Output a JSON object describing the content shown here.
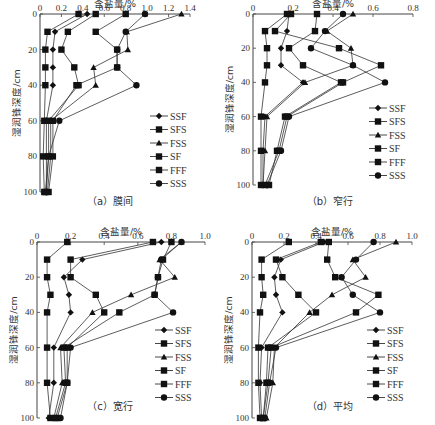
{
  "figure": {
    "x_axis_title": "含盐量/%",
    "y_axis_title": "湿润锋深度/cm",
    "legend": [
      {
        "name": "SSF",
        "marker": "diamond"
      },
      {
        "name": "SFS",
        "marker": "square"
      },
      {
        "name": "FSS",
        "marker": "triangle"
      },
      {
        "name": "SF",
        "marker": "square"
      },
      {
        "name": "FFF",
        "marker": "square"
      },
      {
        "name": "SSS",
        "marker": "circle"
      }
    ]
  },
  "chart_data": [
    {
      "type": "line",
      "title": "（a）膜间",
      "xlabel": "含盐量/%",
      "ylabel": "湿润锋深度/cm",
      "xlim": [
        0,
        1.4
      ],
      "xticks": [
        "0",
        "0.2",
        "0.4",
        "0.6",
        "0.8",
        "1.0",
        "1.2",
        "1.4"
      ],
      "ylim": [
        0,
        100
      ],
      "yticks": [
        "0",
        "20",
        "40",
        "60",
        "80",
        "100"
      ],
      "y": [
        0,
        10,
        20,
        30,
        40,
        60,
        80,
        100
      ],
      "series": [
        {
          "name": "SSF",
          "values": [
            0.44,
            0.14,
            0.12,
            0.12,
            0.12,
            0.06,
            0.06,
            0.06
          ]
        },
        {
          "name": "SFS",
          "values": [
            0.36,
            0.07,
            0.05,
            0.05,
            0.05,
            0.04,
            0.03,
            0.04
          ]
        },
        {
          "name": "FSS",
          "values": [
            1.32,
            0.81,
            0.82,
            0.5,
            0.52,
            0.1,
            0.1,
            0.07
          ]
        },
        {
          "name": "SF",
          "values": [
            0.52,
            0.26,
            0.2,
            0.32,
            0.36,
            0.08,
            0.08,
            0.05
          ]
        },
        {
          "name": "FFF",
          "values": [
            0.8,
            0.52,
            0.72,
            0.72,
            0.34,
            0.12,
            0.12,
            0.08
          ]
        },
        {
          "name": "SSS",
          "values": [
            0.98,
            0.8,
            0.72,
            0.72,
            0.9,
            0.18,
            0.08,
            0.06
          ]
        }
      ]
    },
    {
      "type": "line",
      "title": "（b）窄行",
      "xlabel": "含盐量/%",
      "ylabel": "湿润锋深度/cm",
      "xlim": [
        0,
        0.8
      ],
      "xticks": [
        "0",
        "0.2",
        "0.4",
        "0.6",
        "0.8"
      ],
      "ylim": [
        0,
        100
      ],
      "yticks": [
        "0",
        "20",
        "40",
        "60",
        "80",
        "100"
      ],
      "y": [
        0,
        10,
        20,
        30,
        40,
        60,
        80,
        100
      ],
      "series": [
        {
          "name": "SSF",
          "values": [
            0.18,
            0.17,
            0.14,
            0.14,
            0.25,
            0.06,
            0.05,
            0.05
          ]
        },
        {
          "name": "SFS",
          "values": [
            0.17,
            0.06,
            0.07,
            0.07,
            0.06,
            0.04,
            0.04,
            0.04
          ]
        },
        {
          "name": "FSS",
          "values": [
            0.5,
            0.37,
            0.49,
            0.5,
            0.26,
            0.07,
            0.06,
            0.05
          ]
        },
        {
          "name": "SF",
          "values": [
            0.32,
            0.31,
            0.18,
            0.25,
            0.44,
            0.16,
            0.12,
            0.08
          ]
        },
        {
          "name": "FFF",
          "values": [
            0.19,
            0.11,
            0.43,
            0.64,
            0.45,
            0.17,
            0.13,
            0.06
          ]
        },
        {
          "name": "SSS",
          "values": [
            0.45,
            0.36,
            0.29,
            0.5,
            0.66,
            0.18,
            0.14,
            0.07
          ]
        }
      ]
    },
    {
      "type": "line",
      "title": "（c）宽行",
      "xlabel": "含盐量/%",
      "ylabel": "湿润锋深度/cm",
      "xlim": [
        0,
        1.0
      ],
      "xticks": [
        "0",
        "0.2",
        "0.4",
        "0.6",
        "0.8",
        "1.0"
      ],
      "ylim": [
        0,
        100
      ],
      "yticks": [
        "0",
        "20",
        "40",
        "60",
        "80",
        "100"
      ],
      "y": [
        0,
        10,
        20,
        30,
        40,
        60,
        80,
        100
      ],
      "series": [
        {
          "name": "SSF",
          "values": [
            0.74,
            0.27,
            0.16,
            0.19,
            0.2,
            0.1,
            0.1,
            0.07
          ]
        },
        {
          "name": "SFS",
          "values": [
            0.18,
            0.06,
            0.06,
            0.08,
            0.06,
            0.06,
            0.06,
            0.08
          ]
        },
        {
          "name": "FSS",
          "values": [
            0.86,
            0.73,
            0.82,
            0.56,
            0.33,
            0.14,
            0.15,
            0.1
          ]
        },
        {
          "name": "SF",
          "values": [
            0.69,
            0.2,
            0.2,
            0.35,
            0.4,
            0.18,
            0.18,
            0.12
          ]
        },
        {
          "name": "FFF",
          "values": [
            0.8,
            0.75,
            0.72,
            0.7,
            0.49,
            0.16,
            0.17,
            0.11
          ]
        },
        {
          "name": "SSS",
          "values": [
            0.86,
            0.74,
            0.72,
            0.7,
            0.81,
            0.2,
            0.18,
            0.14
          ]
        }
      ]
    },
    {
      "type": "line",
      "title": "（d）平均",
      "xlabel": "含盐量/%",
      "ylabel": "湿润锋深度/cm",
      "xlim": [
        0,
        1.0
      ],
      "xticks": [
        "0",
        "0.2",
        "0.4",
        "0.6",
        "0.8",
        "1.0"
      ],
      "ylim": [
        0,
        100
      ],
      "yticks": [
        "0",
        "20",
        "40",
        "60",
        "80",
        "100"
      ],
      "y": [
        0,
        10,
        20,
        30,
        40,
        60,
        80,
        100
      ],
      "series": [
        {
          "name": "SSF",
          "values": [
            0.45,
            0.18,
            0.14,
            0.15,
            0.19,
            0.06,
            0.05,
            0.06
          ]
        },
        {
          "name": "SFS",
          "values": [
            0.23,
            0.06,
            0.06,
            0.07,
            0.05,
            0.04,
            0.04,
            0.05
          ]
        },
        {
          "name": "FSS",
          "values": [
            0.9,
            0.63,
            0.71,
            0.5,
            0.36,
            0.14,
            0.13,
            0.09
          ]
        },
        {
          "name": "SF",
          "values": [
            0.43,
            0.15,
            0.19,
            0.29,
            0.4,
            0.1,
            0.09,
            0.07
          ]
        },
        {
          "name": "FFF",
          "values": [
            0.48,
            0.47,
            0.52,
            0.79,
            0.65,
            0.12,
            0.1,
            0.07
          ]
        },
        {
          "name": "SSS",
          "values": [
            0.76,
            0.65,
            0.56,
            0.63,
            0.8,
            0.15,
            0.11,
            0.08
          ]
        }
      ]
    }
  ],
  "layout": {
    "panels": [
      {
        "x0": 40,
        "x1": 190,
        "y0": 14,
        "y1": 192,
        "legend_x": 168,
        "legend_y": 116,
        "caption_x": 110,
        "caption_y": 205,
        "xtitle_y": 7
      },
      {
        "x0": 253,
        "x1": 413,
        "y0": 14,
        "y1": 185,
        "legend_x": 387,
        "legend_y": 108,
        "caption_x": 330,
        "caption_y": 205,
        "xtitle_y": 7
      },
      {
        "x0": 37,
        "x1": 205,
        "y0": 242,
        "y1": 418,
        "legend_x": 173,
        "legend_y": 330,
        "caption_x": 110,
        "caption_y": 410,
        "xtitle_y": 235
      },
      {
        "x0": 252,
        "x1": 412,
        "y0": 242,
        "y1": 418,
        "legend_x": 385,
        "legend_y": 330,
        "caption_x": 330,
        "caption_y": 410,
        "xtitle_y": 235
      }
    ]
  }
}
